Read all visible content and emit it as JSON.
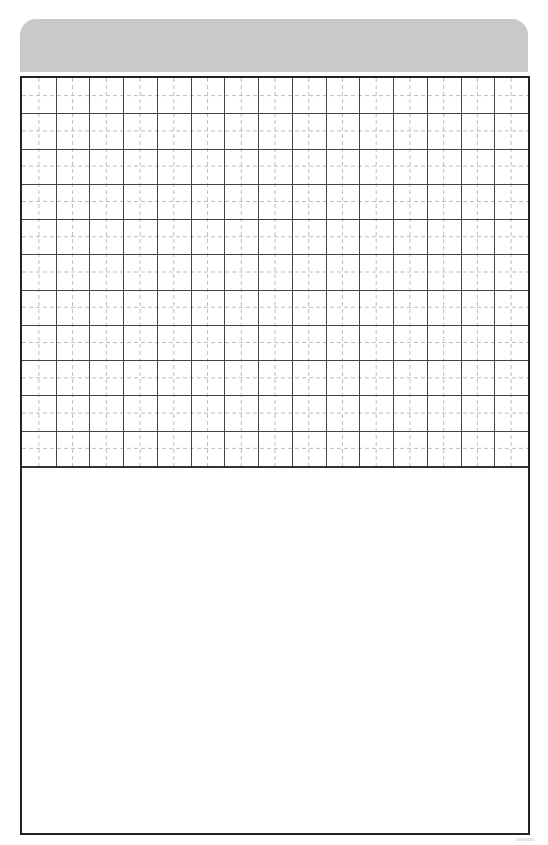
{
  "page": {
    "type": "writing-practice-sheet"
  },
  "banner": {
    "color": "#c9c9c9",
    "text": ""
  },
  "grid": {
    "columns": 15,
    "rows": 11,
    "cell_width": 33.73,
    "cell_height": 35.27,
    "solid_line_color": "#444444",
    "dashed_line_color": "#bdbdbd",
    "guides": "dashed-midlines"
  },
  "writing_area": {
    "text": ""
  },
  "frame": {
    "border_color": "#222222"
  }
}
